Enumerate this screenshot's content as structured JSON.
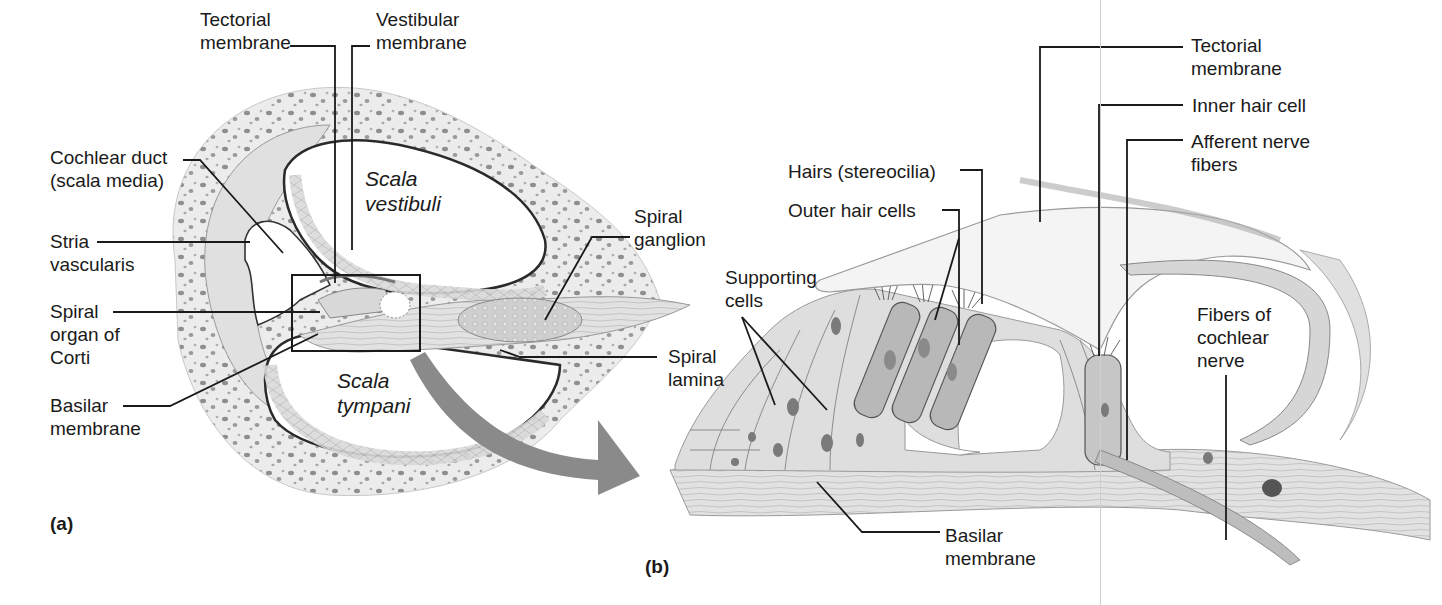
{
  "figure": {
    "panels": [
      {
        "id": "a",
        "label": "(a)",
        "regions": {
          "scala_vestibuli": "Scala\nvestibuli",
          "scala_tympani": "Scala\ntympani"
        },
        "labels": [
          {
            "key": "tectorial_membrane",
            "text": "Tectorial\nmembrane"
          },
          {
            "key": "vestibular_membrane",
            "text": "Vestibular\nmembrane"
          },
          {
            "key": "cochlear_duct",
            "text": "Cochlear duct\n(scala media)"
          },
          {
            "key": "stria_vascularis",
            "text": "Stria\nvascularis"
          },
          {
            "key": "spiral_organ",
            "text": "Spiral\norgan of\nCorti"
          },
          {
            "key": "basilar_membrane",
            "text": "Basilar\nmembrane"
          },
          {
            "key": "spiral_ganglion",
            "text": "Spiral\nganglion"
          },
          {
            "key": "spiral_lamina",
            "text": "Spiral\nlamina"
          }
        ]
      },
      {
        "id": "b",
        "label": "(b)",
        "labels": [
          {
            "key": "tectorial_membrane",
            "text": "Tectorial\nmembrane"
          },
          {
            "key": "inner_hair_cell",
            "text": "Inner hair cell"
          },
          {
            "key": "afferent_nerve_fibers",
            "text": "Afferent nerve\nfibers"
          },
          {
            "key": "hairs_stereocilia",
            "text": "Hairs (stereocilia)"
          },
          {
            "key": "outer_hair_cells",
            "text": "Outer hair cells"
          },
          {
            "key": "supporting_cells",
            "text": "Supporting\ncells"
          },
          {
            "key": "fibers_cochlear_nerve",
            "text": "Fibers of\ncochlear\nnerve"
          },
          {
            "key": "basilar_membrane",
            "text": "Basilar\nmembrane"
          }
        ]
      }
    ],
    "colors": {
      "ink": "#1a1a1a",
      "bone_fill": "#ececec",
      "tissue_fill": "#dcdcdc",
      "cell_fill": "#d2d2d2",
      "hair_cell_fill": "#b4b4b4",
      "nucleus": "#7a7a7a",
      "arrow": "#8a8a8a"
    }
  }
}
